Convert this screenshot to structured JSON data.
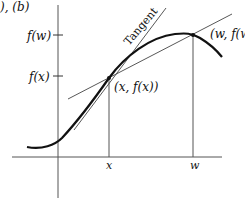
{
  "figure": {
    "corner_label": "), (b)",
    "axis_labels": {
      "fw": "f(w)",
      "fx": "f(x)",
      "x": "x",
      "w": "w"
    },
    "point_labels": {
      "p1": "(x, f(x))",
      "p2": "(w, f(w"
    },
    "tangent_label": "Tangent",
    "colors": {
      "curve": "#111111",
      "axis": "#555555",
      "line": "#444444"
    }
  }
}
